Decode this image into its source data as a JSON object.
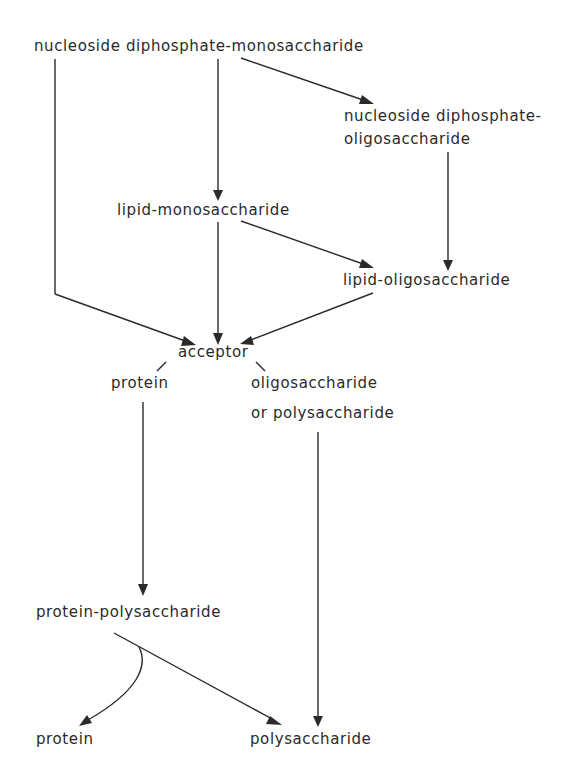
{
  "diagram": {
    "type": "biochemical-pathway",
    "nodes": {
      "nucleoside_diphosphate_monosaccharide": "nucleoside diphosphate-monosaccharide",
      "nucleoside_diphosphate_oligosaccharide_line1": "nucleoside diphosphate-",
      "nucleoside_diphosphate_oligosaccharide_line2": "oligosaccharide",
      "lipid_monosaccharide": "lipid-monosaccharide",
      "lipid_oligosaccharide": "lipid-oligosaccharide",
      "acceptor": "acceptor",
      "acceptor_protein": "protein",
      "acceptor_oligo_line1": "oligosaccharide",
      "acceptor_oligo_line2": "or polysaccharide",
      "protein_polysaccharide": "protein-polysaccharide",
      "product_protein": "protein",
      "product_polysaccharide": "polysaccharide"
    },
    "edges": [
      {
        "from": "nucleoside diphosphate-monosaccharide",
        "to": "nucleoside diphosphate-oligosaccharide"
      },
      {
        "from": "nucleoside diphosphate-monosaccharide",
        "to": "lipid-monosaccharide"
      },
      {
        "from": "nucleoside diphosphate-monosaccharide",
        "to": "acceptor"
      },
      {
        "from": "nucleoside diphosphate-oligosaccharide",
        "to": "lipid-oligosaccharide"
      },
      {
        "from": "lipid-monosaccharide",
        "to": "lipid-oligosaccharide"
      },
      {
        "from": "lipid-monosaccharide",
        "to": "acceptor"
      },
      {
        "from": "lipid-oligosaccharide",
        "to": "acceptor"
      },
      {
        "from": "acceptor",
        "to": "protein"
      },
      {
        "from": "acceptor",
        "to": "oligosaccharide or polysaccharide"
      },
      {
        "from": "protein",
        "to": "protein-polysaccharide"
      },
      {
        "from": "oligosaccharide or polysaccharide",
        "to": "polysaccharide"
      },
      {
        "from": "protein-polysaccharide",
        "to": "protein"
      },
      {
        "from": "protein-polysaccharide",
        "to": "polysaccharide"
      }
    ],
    "colors": {
      "ink": "#2a2a2a",
      "background": "#ffffff"
    }
  }
}
